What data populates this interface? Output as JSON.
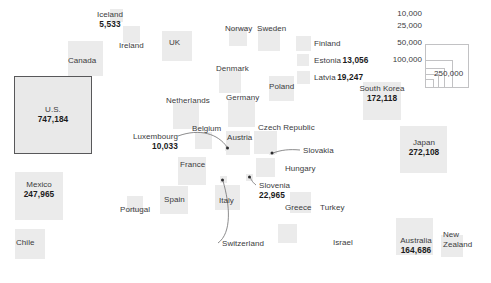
{
  "chart_data": {
    "type": "treemap",
    "title": "",
    "subtitle": "",
    "xlabel": "",
    "ylabel": "",
    "value_unit": "count",
    "encoding": "square area proportional to value",
    "legend": {
      "position": "top-right",
      "style": "nested-squares-shared-corner",
      "entries": [
        {
          "label": "10,000",
          "value": 10000
        },
        {
          "label": "25,000",
          "value": 25000
        },
        {
          "label": "50,000",
          "value": 50000
        },
        {
          "label": "100,000",
          "value": 100000
        },
        {
          "label": "250,000",
          "value": 250000
        }
      ]
    },
    "labeled_values": [
      {
        "name": "U.S.",
        "label": "U.S.",
        "value": 747184,
        "display": "747,184"
      },
      {
        "name": "Japan",
        "label": "Japan",
        "value": 272108,
        "display": "272,108"
      },
      {
        "name": "Mexico",
        "label": "Mexico",
        "value": 247965,
        "display": "247,965"
      },
      {
        "name": "South Korea",
        "label": "South Korea",
        "value": 172118,
        "display": "172,118"
      },
      {
        "name": "Australia",
        "label": "Australia",
        "value": 164686,
        "display": "164,686"
      },
      {
        "name": "Slovenia",
        "label": "Slovenia",
        "value": 22965,
        "display": "22,965"
      },
      {
        "name": "Latvia",
        "label": "Latvia",
        "value": 19247,
        "display": "19,247"
      },
      {
        "name": "Estonia",
        "label": "Estonia",
        "value": 13056,
        "display": "13,056"
      },
      {
        "name": "Luxembourg",
        "label": "Luxembourg",
        "value": 10033,
        "display": "10,033"
      },
      {
        "name": "Iceland",
        "label": "Iceland",
        "value": 5533,
        "display": "5,533"
      }
    ],
    "unlabeled_countries": [
      "Canada",
      "Chile",
      "Ireland",
      "UK",
      "Norway",
      "Sweden",
      "Denmark",
      "Finland",
      "Netherlands",
      "Germany",
      "Poland",
      "Belgium",
      "Austria",
      "Czech Republic",
      "Slovakia",
      "Hungary",
      "France",
      "Switzerland",
      "Italy",
      "Spain",
      "Portugal",
      "Greece",
      "Turkey",
      "Israel",
      "New Zealand"
    ]
  },
  "legend": {
    "e10k": "10,000",
    "e25k": "25,000",
    "e50k": "50,000",
    "e100k": "100,000",
    "e250k": "250,000"
  },
  "nodes": {
    "us": {
      "label": "U.S.",
      "value": "747,184"
    },
    "canada": {
      "label": "Canada"
    },
    "mexico": {
      "label": "Mexico",
      "value": "247,965"
    },
    "chile": {
      "label": "Chile"
    },
    "iceland": {
      "label": "Iceland",
      "value": "5,533"
    },
    "ireland": {
      "label": "Ireland"
    },
    "uk": {
      "label": "UK"
    },
    "norway": {
      "label": "Norway"
    },
    "sweden": {
      "label": "Sweden"
    },
    "finland": {
      "label": "Finland"
    },
    "estonia": {
      "label": "Estonia",
      "value": "13,056"
    },
    "latvia": {
      "label": "Latvia",
      "value": "19,247"
    },
    "denmark": {
      "label": "Denmark"
    },
    "netherlands": {
      "label": "Netherlands"
    },
    "germany": {
      "label": "Germany"
    },
    "poland": {
      "label": "Poland"
    },
    "belgium": {
      "label": "Belgium"
    },
    "luxembourg": {
      "label": "Luxembourg",
      "value": "10,033"
    },
    "austria": {
      "label": "Austria"
    },
    "czech": {
      "label": "Czech Republic"
    },
    "slovakia": {
      "label": "Slovakia"
    },
    "hungary": {
      "label": "Hungary"
    },
    "france": {
      "label": "France"
    },
    "switzerland": {
      "label": "Switzerland"
    },
    "italy": {
      "label": "Italy"
    },
    "slovenia": {
      "label": "Slovenia",
      "value": "22,965"
    },
    "spain": {
      "label": "Spain"
    },
    "portugal": {
      "label": "Portugal"
    },
    "greece": {
      "label": "Greece"
    },
    "turkey": {
      "label": "Turkey"
    },
    "israel": {
      "label": "Israel"
    },
    "southkorea": {
      "label": "South Korea",
      "value": "172,118"
    },
    "japan": {
      "label": "Japan",
      "value": "272,108"
    },
    "australia": {
      "label": "Australia",
      "value": "164,686"
    },
    "newzealand": {
      "label": "New Zealand"
    }
  },
  "colors": {
    "square_fill": "#ebebeb",
    "highlight_border": "#58585a",
    "legend_border": "#c2c2c4",
    "label_text": "#3b3b3d",
    "value_text": "#1b1b1c",
    "leader_line": "#6e6e70",
    "background": "#ffffff"
  }
}
